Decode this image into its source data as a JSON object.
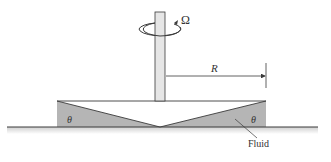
{
  "diagram": {
    "labels": {
      "omega": "Ω",
      "radius": "R",
      "angle_left": "θ",
      "angle_right": "θ",
      "fluid": "Fluid"
    },
    "colors": {
      "fluid_fill": "#b5b5b5",
      "shaft_fill": "#e6e6e6",
      "line": "#3a3a3a",
      "surface_shadow": "#d9d9d9"
    }
  }
}
